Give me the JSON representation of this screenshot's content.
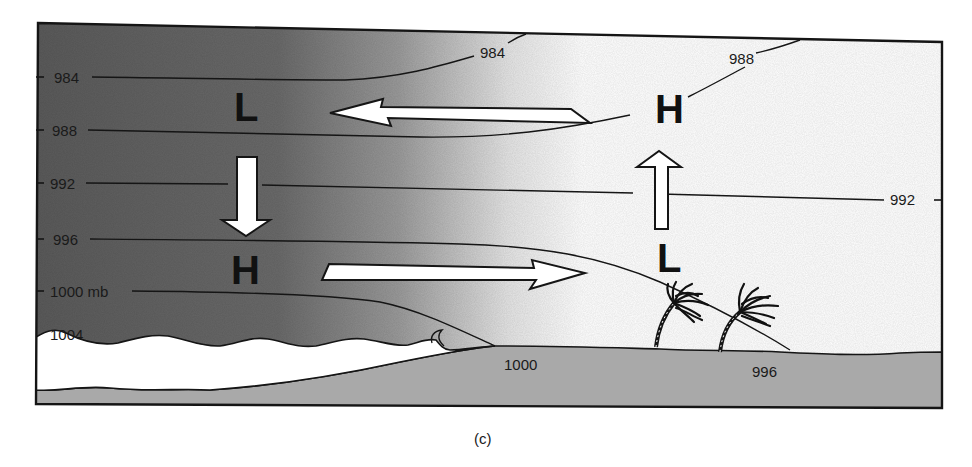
{
  "figure": {
    "caption": "(c)",
    "colors": {
      "sky_dark": "#5e5e5e",
      "sky_light": "#ffffff",
      "land": "#a9a9a9",
      "sea": "#ffffff",
      "outline": "#151515"
    }
  },
  "isobars": {
    "left_labels": [
      "984",
      "988",
      "992",
      "996",
      "1000 mb",
      "1004"
    ],
    "right_labels": {
      "top_984": "984",
      "top_988": "988",
      "right_992": "992",
      "ground_1000": "1000",
      "ground_996": "996"
    }
  },
  "pressure_centers": {
    "upper_left": "L",
    "lower_left": "H",
    "upper_right": "H",
    "lower_right": "L"
  },
  "arrows": [
    {
      "id": "aloft-return-flow",
      "direction": "left"
    },
    {
      "id": "sinking-over-sea",
      "direction": "down"
    },
    {
      "id": "surface-sea-breeze",
      "direction": "right"
    },
    {
      "id": "rising-over-land",
      "direction": "up"
    }
  ],
  "features": [
    "sea",
    "land",
    "palm-tree",
    "palm-tree"
  ]
}
